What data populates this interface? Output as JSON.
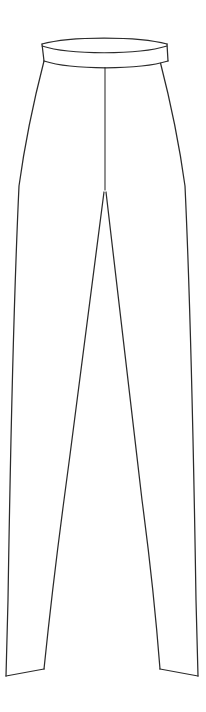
{
  "document": {
    "title": "Trousers Technical Flat",
    "garment_type": "trousers",
    "view": "front",
    "style": "line-drawing",
    "canvas_width": 206,
    "canvas_height": 712
  },
  "colors": {
    "background": "#ffffff",
    "line": "#2b2b2b",
    "fill": "#ffffff"
  },
  "parts": [
    {
      "id": "waistband",
      "label": "Waistband",
      "interactable": false
    },
    {
      "id": "waistband-seam",
      "label": "Waistband Seam",
      "interactable": false
    },
    {
      "id": "center-front-seam",
      "label": "Center Front Seam",
      "interactable": false
    },
    {
      "id": "left-outer-seam",
      "label": "Left Outer Side Seam",
      "interactable": false
    },
    {
      "id": "right-outer-seam",
      "label": "Right Outer Side Seam",
      "interactable": false
    },
    {
      "id": "left-inner-seam",
      "label": "Left Inseam",
      "interactable": false
    },
    {
      "id": "right-inner-seam",
      "label": "Right Inseam",
      "interactable": false
    },
    {
      "id": "left-hem",
      "label": "Left Leg Hem",
      "interactable": false
    },
    {
      "id": "right-hem",
      "label": "Right Leg Hem",
      "interactable": false
    }
  ],
  "geometry": {
    "waistband": {
      "left_x": 42,
      "right_x": 168,
      "top_y": 38,
      "bottom_y": 63,
      "curve_depth": 9
    },
    "crotch_point": {
      "x": 105,
      "y": 190
    },
    "hip_widest": {
      "left_x": 17,
      "right_x": 188,
      "y": 195
    },
    "left_hem": {
      "outer_x": 6,
      "inner_x": 44,
      "y_outer": 676,
      "y_inner": 669
    },
    "right_hem": {
      "outer_x": 198,
      "inner_x": 160,
      "y_outer": 676,
      "y_inner": 669
    },
    "center_seam": {
      "x": 105,
      "top_y": 62,
      "bottom_y": 190
    }
  },
  "annotations": {
    "caption": "",
    "measurements": []
  }
}
